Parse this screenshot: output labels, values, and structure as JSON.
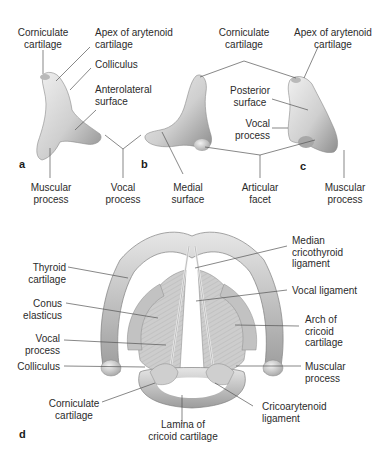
{
  "figure": {
    "panels": {
      "a": "a",
      "b": "b",
      "c": "c",
      "d": "d"
    },
    "top_labels": {
      "corniculate_a": "Corniculate\ncartilage",
      "apex_a": "Apex of arytenoid\ncartilage",
      "colliculus_a": "Colliculus",
      "anterolateral": "Anterolateral\nsurface",
      "muscular_a": "Muscular\nprocess",
      "vocal_ab": "Vocal\nprocess",
      "medial": "Medial\nsurface",
      "articular": "Articular\nfacet",
      "muscular_c": "Muscular\nprocess",
      "corniculate_bc": "Corniculate\ncartilage",
      "apex_c": "Apex of arytenoid\ncartilage",
      "posterior": "Posterior\nsurface",
      "vocal_c": "Vocal\nprocess"
    },
    "bottom_labels": {
      "thyroid": "Thyroid\ncartilage",
      "conus": "Conus\nelasticus",
      "vocal_process": "Vocal\nprocess",
      "colliculus": "Colliculus",
      "corniculate": "Corniculate\ncartilage",
      "lamina": "Lamina of\ncricoid cartilage",
      "cricoarytenoid": "Cricoarytenoid\nligament",
      "muscular": "Muscular\nprocess",
      "arch": "Arch of\ncricoid\ncartilage",
      "vocal_ligament": "Vocal ligament",
      "median_cricothyroid": "Median\ncricothyroid\nligament"
    },
    "colors": {
      "cartilage_fill": "#d9d9d9",
      "cartilage_shadow": "#9a9a9a",
      "leader_line": "#555555",
      "text": "#2b2b2b"
    }
  }
}
